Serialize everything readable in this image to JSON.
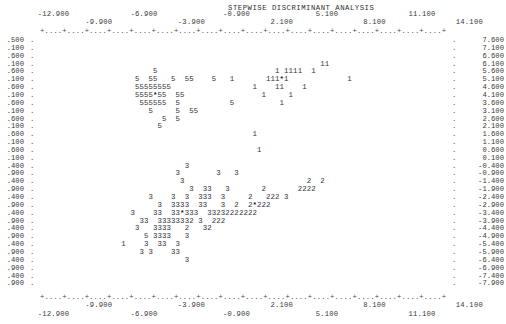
{
  "title": "STEPWISE DISCRIMINANT ANALYSIS",
  "axis": {
    "x_labels_upper": [
      "-12.900",
      "-6.900",
      "2.100",
      "8.100",
      "14.100"
    ],
    "x_labels_lower": [
      "-9.900",
      "-3.900",
      "-0.900",
      "5.100",
      "11.100"
    ],
    "x_tick_string": "+....+....+....+....+....+....+....+....+....+....+....+....+....+....+....+....+....+....+",
    "x_ticks_top_row1": [
      "-12.900",
      "-6.900",
      "-0.900",
      "5.100",
      "11.100"
    ],
    "x_ticks_top_row2": [
      "-9.900",
      "-3.900",
      "2.100",
      "8.100",
      "14.100"
    ],
    "x_ticks_bottom_row1": [
      "-9.900",
      "-3.900",
      "2.100",
      "8.100",
      "14.100"
    ],
    "x_ticks_bottom_row2": [
      "-12.900",
      "-6.900",
      "-0.900",
      "5.100",
      "11.100"
    ],
    "y_labels_right": [
      "7.600",
      "7.100",
      "6.600",
      "6.100",
      "5.600",
      "5.100",
      "4.600",
      "4.100",
      "3.600",
      "3.100",
      "2.600",
      "2.100",
      "1.600",
      "1.100",
      "0.600",
      "0.100",
      "-0.400",
      "-0.900",
      "-1.400",
      "-1.900",
      "-2.400",
      "-2.900",
      "-3.400",
      "-3.900",
      "-4.400",
      "-4.900",
      "-5.400",
      "-5.900",
      "-6.400",
      "-6.900",
      "-7.400",
      "-7.900"
    ],
    "y_labels_left": [
      ".500",
      ".100",
      ".600",
      ".100",
      ".600",
      ".100",
      ".600",
      ".100",
      ".600",
      ".100",
      ".600",
      ".100",
      ".600",
      ".100",
      ".600",
      ".100",
      ".400",
      ".900",
      ".400",
      ".900",
      ".400",
      ".900",
      ".400",
      ".900",
      ".400",
      ".900",
      ".400",
      ".900",
      ".400",
      ".900",
      ".400",
      ".900"
    ],
    "x_min": -12.9,
    "x_max": 14.1,
    "y_min": -7.9,
    "y_max": 7.6
  },
  "chart_data": {
    "type": "scatter",
    "title": "STEPWISE DISCRIMINANT ANALYSIS",
    "xlabel": "",
    "ylabel": "",
    "xlim": [
      -13.4,
      14.6
    ],
    "ylim": [
      -8.1,
      7.8
    ],
    "grid": false,
    "legend": "none",
    "marker_encoding": "group number plotted as character; '*' marks group centroid",
    "groups": [
      {
        "name": "1",
        "symbol": "1",
        "centroid": [
          8.0,
          4.6
        ]
      },
      {
        "name": "2",
        "symbol": "2",
        "centroid": [
          6.2,
          -2.4
        ]
      },
      {
        "name": "3",
        "symbol": "3",
        "centroid": [
          0.6,
          -2.9
        ]
      },
      {
        "name": "5",
        "symbol": "5",
        "centroid": [
          -6.3,
          4.6
        ]
      }
    ],
    "rows": [
      {
        "y": "7.600",
        "cells": ""
      },
      {
        "y": "7.100",
        "cells": ""
      },
      {
        "y": "6.600",
        "cells": ""
      },
      {
        "y": "6.100",
        "cells": "                                                              11"
      },
      {
        "y": "5.600",
        "cells": "                         5                          1 1111  1"
      },
      {
        "y": "5.100",
        "cells": "                     5  55   5  55         111*11111"
      },
      {
        "y": "4.600",
        "cells": "                     55555555             1 11111 111"
      },
      {
        "y": "4.100",
        "cells": "                     5555*55  55           111  11   1"
      },
      {
        "y": "3.600",
        "cells": "                      555555  5                 1 1"
      },
      {
        "y": "3.100",
        "cells": "                        5     5  55"
      },
      {
        "y": "2.600",
        "cells": "                           5  5"
      },
      {
        "y": "2.100",
        "cells": "                          5"
      },
      {
        "y": "1.600",
        "cells": "                                               1"
      },
      {
        "y": "1.100",
        "cells": ""
      },
      {
        "y": "0.600",
        "cells": "                                                1"
      },
      {
        "y": "0.100",
        "cells": ""
      },
      {
        "y": "-0.400",
        "cells": "                                3"
      },
      {
        "y": "-0.900",
        "cells": "                              3        3   3"
      },
      {
        "y": "-1.400",
        "cells": "                               3                           2  2"
      },
      {
        "y": "-1.900",
        "cells": "                                 3  33   3        2222   22222"
      },
      {
        "y": "-2.400",
        "cells": "                        3    3  3  333  3      2   3222  3"
      },
      {
        "y": "-2.900",
        "cells": "                          3  3333   33   3  2  2*222"
      },
      {
        "y": "-3.400",
        "cells": "                    3    33  33*333   3323222222"
      },
      {
        "y": "-3.900",
        "cells": "                      33  333333332 3  222"
      },
      {
        "y": "-4.400",
        "cells": "                     3   3333    2   32"
      },
      {
        "y": "-4.900",
        "cells": "                       5 3333   3"
      },
      {
        "y": "-5.400",
        "cells": "                  1    3  33  3"
      },
      {
        "y": "-5.900",
        "cells": "                      3 3    33"
      },
      {
        "y": "-6.400",
        "cells": "                                3"
      },
      {
        "y": "-6.900",
        "cells": ""
      },
      {
        "y": "-7.400",
        "cells": ""
      },
      {
        "y": "-7.900",
        "cells": ""
      }
    ],
    "points": [
      {
        "g": "5",
        "col": 25,
        "row": 4
      },
      {
        "g": "5",
        "col": 21,
        "row": 5
      },
      {
        "g": "5",
        "col": 24,
        "row": 5
      },
      {
        "g": "5",
        "col": 25,
        "row": 5
      },
      {
        "g": "5",
        "col": 29,
        "row": 5
      },
      {
        "g": "5",
        "col": 32,
        "row": 5
      },
      {
        "g": "5",
        "col": 33,
        "row": 5
      },
      {
        "g": "5",
        "col": 38,
        "row": 5
      },
      {
        "g": "5",
        "col": 21,
        "row": 6
      },
      {
        "g": "5",
        "col": 22,
        "row": 6
      },
      {
        "g": "5",
        "col": 23,
        "row": 6
      },
      {
        "g": "5",
        "col": 24,
        "row": 6
      },
      {
        "g": "5",
        "col": 25,
        "row": 6
      },
      {
        "g": "5",
        "col": 26,
        "row": 6
      },
      {
        "g": "5",
        "col": 27,
        "row": 6
      },
      {
        "g": "5",
        "col": 28,
        "row": 6
      },
      {
        "g": "5",
        "col": 21,
        "row": 7
      },
      {
        "g": "5",
        "col": 22,
        "row": 7
      },
      {
        "g": "5",
        "col": 23,
        "row": 7
      },
      {
        "g": "5",
        "col": 24,
        "row": 7
      },
      {
        "g": "*",
        "col": 25,
        "row": 7
      },
      {
        "g": "5",
        "col": 26,
        "row": 7
      },
      {
        "g": "5",
        "col": 27,
        "row": 7
      },
      {
        "g": "5",
        "col": 30,
        "row": 7
      },
      {
        "g": "5",
        "col": 31,
        "row": 7
      },
      {
        "g": "5",
        "col": 22,
        "row": 8
      },
      {
        "g": "5",
        "col": 23,
        "row": 8
      },
      {
        "g": "5",
        "col": 24,
        "row": 8
      },
      {
        "g": "5",
        "col": 25,
        "row": 8
      },
      {
        "g": "5",
        "col": 26,
        "row": 8
      },
      {
        "g": "5",
        "col": 27,
        "row": 8
      },
      {
        "g": "5",
        "col": 30,
        "row": 8
      },
      {
        "g": "5",
        "col": 42,
        "row": 8
      },
      {
        "g": "5",
        "col": 24,
        "row": 9
      },
      {
        "g": "5",
        "col": 30,
        "row": 9
      },
      {
        "g": "5",
        "col": 33,
        "row": 9
      },
      {
        "g": "5",
        "col": 34,
        "row": 9
      },
      {
        "g": "5",
        "col": 27,
        "row": 10
      },
      {
        "g": "5",
        "col": 30,
        "row": 10
      },
      {
        "g": "5",
        "col": 26,
        "row": 11
      },
      {
        "g": "1",
        "col": 62,
        "row": 3
      },
      {
        "g": "1",
        "col": 63,
        "row": 3
      },
      {
        "g": "1",
        "col": 52,
        "row": 4
      },
      {
        "g": "1",
        "col": 54,
        "row": 4
      },
      {
        "g": "1",
        "col": 55,
        "row": 4
      },
      {
        "g": "1",
        "col": 56,
        "row": 4
      },
      {
        "g": "1",
        "col": 57,
        "row": 4
      },
      {
        "g": "1",
        "col": 60,
        "row": 4
      },
      {
        "g": "1",
        "col": 42,
        "row": 5
      },
      {
        "g": "1",
        "col": 50,
        "row": 5
      },
      {
        "g": "1",
        "col": 51,
        "row": 5
      },
      {
        "g": "1",
        "col": 52,
        "row": 5
      },
      {
        "g": "*",
        "col": 53,
        "row": 5
      },
      {
        "g": "1",
        "col": 54,
        "row": 5
      },
      {
        "g": "1",
        "col": 68,
        "row": 5
      },
      {
        "g": "1",
        "col": 47,
        "row": 6
      },
      {
        "g": "1",
        "col": 52,
        "row": 6
      },
      {
        "g": "1",
        "col": 53,
        "row": 6
      },
      {
        "g": "1",
        "col": 58,
        "row": 6
      },
      {
        "g": "1",
        "col": 49,
        "row": 7
      },
      {
        "g": "1",
        "col": 55,
        "row": 7
      },
      {
        "g": "1",
        "col": 53,
        "row": 8
      },
      {
        "g": "1",
        "col": 47,
        "row": 12
      },
      {
        "g": "1",
        "col": 48,
        "row": 14
      },
      {
        "g": "3",
        "col": 32,
        "row": 16
      },
      {
        "g": "3",
        "col": 30,
        "row": 17
      },
      {
        "g": "3",
        "col": 39,
        "row": 17
      },
      {
        "g": "3",
        "col": 43,
        "row": 17
      },
      {
        "g": "3",
        "col": 31,
        "row": 18
      },
      {
        "g": "2",
        "col": 59,
        "row": 18
      },
      {
        "g": "2",
        "col": 62,
        "row": 18
      },
      {
        "g": "3",
        "col": 33,
        "row": 19
      },
      {
        "g": "3",
        "col": 36,
        "row": 19
      },
      {
        "g": "3",
        "col": 37,
        "row": 19
      },
      {
        "g": "3",
        "col": 41,
        "row": 19
      },
      {
        "g": "2",
        "col": 49,
        "row": 19
      },
      {
        "g": "2",
        "col": 57,
        "row": 19
      },
      {
        "g": "2",
        "col": 58,
        "row": 19
      },
      {
        "g": "2",
        "col": 59,
        "row": 19
      },
      {
        "g": "2",
        "col": 60,
        "row": 19
      },
      {
        "g": "3",
        "col": 24,
        "row": 20
      },
      {
        "g": "3",
        "col": 29,
        "row": 20
      },
      {
        "g": "3",
        "col": 32,
        "row": 20
      },
      {
        "g": "3",
        "col": 35,
        "row": 20
      },
      {
        "g": "3",
        "col": 36,
        "row": 20
      },
      {
        "g": "3",
        "col": 37,
        "row": 20
      },
      {
        "g": "3",
        "col": 40,
        "row": 20
      },
      {
        "g": "2",
        "col": 46,
        "row": 20
      },
      {
        "g": "2",
        "col": 50,
        "row": 20
      },
      {
        "g": "2",
        "col": 51,
        "row": 20
      },
      {
        "g": "2",
        "col": 52,
        "row": 20
      },
      {
        "g": "3",
        "col": 54,
        "row": 20
      },
      {
        "g": "3",
        "col": 26,
        "row": 21
      },
      {
        "g": "3",
        "col": 29,
        "row": 21
      },
      {
        "g": "3",
        "col": 30,
        "row": 21
      },
      {
        "g": "3",
        "col": 31,
        "row": 21
      },
      {
        "g": "3",
        "col": 32,
        "row": 21
      },
      {
        "g": "3",
        "col": 35,
        "row": 21
      },
      {
        "g": "3",
        "col": 36,
        "row": 21
      },
      {
        "g": "3",
        "col": 40,
        "row": 21
      },
      {
        "g": "2",
        "col": 43,
        "row": 21
      },
      {
        "g": "2",
        "col": 46,
        "row": 21
      },
      {
        "g": "*",
        "col": 47,
        "row": 21
      },
      {
        "g": "2",
        "col": 48,
        "row": 21
      },
      {
        "g": "2",
        "col": 49,
        "row": 21
      },
      {
        "g": "2",
        "col": 50,
        "row": 21
      },
      {
        "g": "3",
        "col": 20,
        "row": 22
      },
      {
        "g": "3",
        "col": 25,
        "row": 22
      },
      {
        "g": "3",
        "col": 26,
        "row": 22
      },
      {
        "g": "3",
        "col": 29,
        "row": 22
      },
      {
        "g": "3",
        "col": 30,
        "row": 22
      },
      {
        "g": "*",
        "col": 31,
        "row": 22
      },
      {
        "g": "3",
        "col": 32,
        "row": 22
      },
      {
        "g": "3",
        "col": 33,
        "row": 22
      },
      {
        "g": "3",
        "col": 34,
        "row": 22
      },
      {
        "g": "3",
        "col": 37,
        "row": 22
      },
      {
        "g": "3",
        "col": 38,
        "row": 22
      },
      {
        "g": "2",
        "col": 39,
        "row": 22
      },
      {
        "g": "3",
        "col": 40,
        "row": 22
      },
      {
        "g": "2",
        "col": 41,
        "row": 22
      },
      {
        "g": "2",
        "col": 42,
        "row": 22
      },
      {
        "g": "2",
        "col": 43,
        "row": 22
      },
      {
        "g": "2",
        "col": 44,
        "row": 22
      },
      {
        "g": "2",
        "col": 45,
        "row": 22
      },
      {
        "g": "2",
        "col": 46,
        "row": 22
      },
      {
        "g": "2",
        "col": 47,
        "row": 22
      },
      {
        "g": "3",
        "col": 22,
        "row": 23
      },
      {
        "g": "3",
        "col": 23,
        "row": 23
      },
      {
        "g": "3",
        "col": 26,
        "row": 23
      },
      {
        "g": "3",
        "col": 27,
        "row": 23
      },
      {
        "g": "3",
        "col": 28,
        "row": 23
      },
      {
        "g": "3",
        "col": 29,
        "row": 23
      },
      {
        "g": "3",
        "col": 30,
        "row": 23
      },
      {
        "g": "3",
        "col": 31,
        "row": 23
      },
      {
        "g": "3",
        "col": 32,
        "row": 23
      },
      {
        "g": "2",
        "col": 33,
        "row": 23
      },
      {
        "g": "3",
        "col": 35,
        "row": 23
      },
      {
        "g": "2",
        "col": 38,
        "row": 23
      },
      {
        "g": "2",
        "col": 39,
        "row": 23
      },
      {
        "g": "2",
        "col": 40,
        "row": 23
      },
      {
        "g": "3",
        "col": 21,
        "row": 24
      },
      {
        "g": "3",
        "col": 25,
        "row": 24
      },
      {
        "g": "3",
        "col": 26,
        "row": 24
      },
      {
        "g": "3",
        "col": 27,
        "row": 24
      },
      {
        "g": "3",
        "col": 28,
        "row": 24
      },
      {
        "g": "2",
        "col": 32,
        "row": 24
      },
      {
        "g": "3",
        "col": 36,
        "row": 24
      },
      {
        "g": "2",
        "col": 37,
        "row": 24
      },
      {
        "g": "5",
        "col": 23,
        "row": 25
      },
      {
        "g": "3",
        "col": 25,
        "row": 25
      },
      {
        "g": "3",
        "col": 26,
        "row": 25
      },
      {
        "g": "3",
        "col": 27,
        "row": 25
      },
      {
        "g": "3",
        "col": 28,
        "row": 25
      },
      {
        "g": "3",
        "col": 32,
        "row": 25
      },
      {
        "g": "1",
        "col": 18,
        "row": 26
      },
      {
        "g": "3",
        "col": 23,
        "row": 26
      },
      {
        "g": "3",
        "col": 26,
        "row": 26
      },
      {
        "g": "3",
        "col": 27,
        "row": 26
      },
      {
        "g": "3",
        "col": 30,
        "row": 26
      },
      {
        "g": "3",
        "col": 22,
        "row": 27
      },
      {
        "g": "3",
        "col": 24,
        "row": 27
      },
      {
        "g": "3",
        "col": 29,
        "row": 27
      },
      {
        "g": "3",
        "col": 30,
        "row": 27
      },
      {
        "g": "3",
        "col": 32,
        "row": 28
      }
    ]
  }
}
